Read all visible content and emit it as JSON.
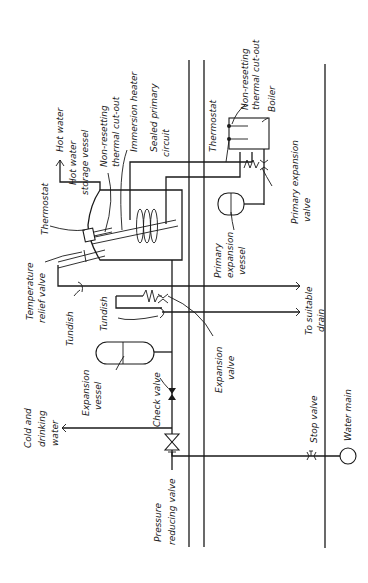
{
  "diagram": {
    "orientation": "rotated 90 degrees counter-clockwise",
    "stroke_color": "#1a1a1a",
    "background": "#ffffff",
    "labels": {
      "hot_water": "Hot water",
      "hot_water_storage_vessel_1": "Hot water",
      "hot_water_storage_vessel_2": "storage vessel",
      "non_resetting_1": "Non-resetting",
      "non_resetting_2": "thermal cut-out",
      "immersion_heater": "Immersion heater",
      "sealed_primary_1": "Sealed primary",
      "sealed_primary_2": "circuit",
      "thermostat_vessel": "Thermostat",
      "thermostat_boiler": "Thermostat",
      "boiler_non_resetting_1": "Non-resetting",
      "boiler_non_resetting_2": "thermal cut-out",
      "boiler": "Boiler",
      "primary_expansion_valve_1": "Primary expansion",
      "primary_expansion_valve_2": "valve",
      "primary_expansion_vessel_1": "Primary",
      "primary_expansion_vessel_2": "expansion",
      "primary_expansion_vessel_3": "vessel",
      "temp_relief_1": "Temperature",
      "temp_relief_2": "relief valve",
      "tundish_1": "Tundish",
      "tundish_2": "Tundish",
      "to_drain_1": "To suitable",
      "to_drain_2": "drain",
      "expansion_valve_1": "Expansion",
      "expansion_valve_2": "valve",
      "expansion_vessel_1": "Expansion",
      "expansion_vessel_2": "vessel",
      "check_valve": "Check valve",
      "cold_drinking_1": "Cold and",
      "cold_drinking_2": "drinking",
      "cold_drinking_3": "water",
      "pressure_reducing_1": "Pressure",
      "pressure_reducing_2": "reducing valve",
      "stop_valve": "Stop valve",
      "water_main": "Water main"
    }
  }
}
